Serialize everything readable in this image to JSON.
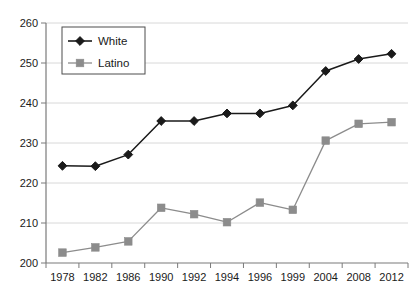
{
  "chart_data": {
    "type": "line",
    "title": "",
    "subtitle": "",
    "xlabel": "",
    "ylabel": "",
    "categories": [
      "1978",
      "1982",
      "1986",
      "1990",
      "1992",
      "1994",
      "1996",
      "1999",
      "2004",
      "2008",
      "2012"
    ],
    "ylim": [
      200,
      260
    ],
    "ytick_values": [
      200,
      210,
      220,
      230,
      240,
      250,
      260
    ],
    "ytick_labels": [
      "200",
      "210",
      "220",
      "230",
      "240",
      "250",
      "260"
    ],
    "grid": true,
    "grid_axis": "y",
    "legend_position": "top-left-inside",
    "series": [
      {
        "name": "White",
        "color": "#1a1a1a",
        "marker": "diamond",
        "values": [
          224.3,
          224.2,
          227.1,
          235.5,
          235.5,
          237.4,
          237.4,
          239.4,
          248.0,
          251.0,
          252.3
        ]
      },
      {
        "name": "Latino",
        "color": "#8c8c8c",
        "marker": "square",
        "values": [
          202.6,
          203.9,
          205.4,
          213.8,
          212.2,
          210.2,
          215.1,
          213.3,
          230.6,
          234.8,
          235.2
        ]
      }
    ]
  },
  "legend": {
    "items": [
      {
        "label": "White"
      },
      {
        "label": "Latino"
      }
    ]
  },
  "axes": {
    "y_min_label": "200",
    "y_max_label": "260"
  },
  "colors": {
    "white_series": "#1a1a1a",
    "latino_series": "#8c8c8c",
    "gridline": "#d8d8d8",
    "axis": "#7a7a7a",
    "background": "#ffffff"
  }
}
